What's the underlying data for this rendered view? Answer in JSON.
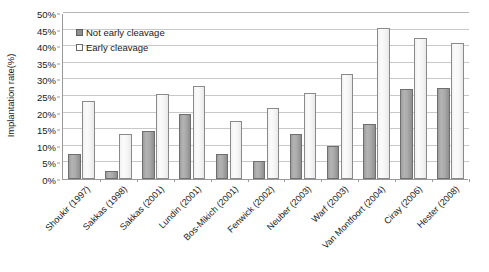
{
  "chart_data": {
    "type": "bar",
    "title": "",
    "xlabel": "",
    "ylabel": "Implantation rate(%)",
    "ylim": [
      0,
      50
    ],
    "ytick_labels": [
      "0%",
      "5%",
      "10%",
      "15%",
      "20%",
      "25%",
      "30%",
      "35%",
      "40%",
      "45%",
      "50%"
    ],
    "ytick_values": [
      0,
      5,
      10,
      15,
      20,
      25,
      30,
      35,
      40,
      45,
      50
    ],
    "grid": true,
    "legend_position": "top-left",
    "categories": [
      "Shoukir (1997)",
      "Sakkas (1998)",
      "Sakkas (2001)",
      "Lundin (2001)",
      "Bos-Mikich (2001)",
      "Fenwick (2002)",
      "Neuber (2003)",
      "Warf (2003)",
      "Van Montfoort (2004)",
      "Ciray (2006)",
      "Hester (2008)"
    ],
    "series": [
      {
        "name": "Not early cleavage",
        "color": "#a8a8a8",
        "values": [
          7.5,
          2.5,
          14.5,
          19.5,
          7.5,
          5.5,
          13.5,
          10.0,
          16.5,
          27.0,
          27.5
        ]
      },
      {
        "name": "Early cleavage",
        "color": "#f5f5f5",
        "values": [
          23.5,
          13.5,
          25.5,
          28.0,
          17.5,
          21.5,
          26.0,
          31.5,
          45.5,
          42.5,
          41.0
        ]
      }
    ]
  },
  "legend": {
    "items": [
      {
        "label": "Not early cleavage",
        "swatch": "dark"
      },
      {
        "label": "Early cleavage",
        "swatch": "light"
      }
    ]
  }
}
